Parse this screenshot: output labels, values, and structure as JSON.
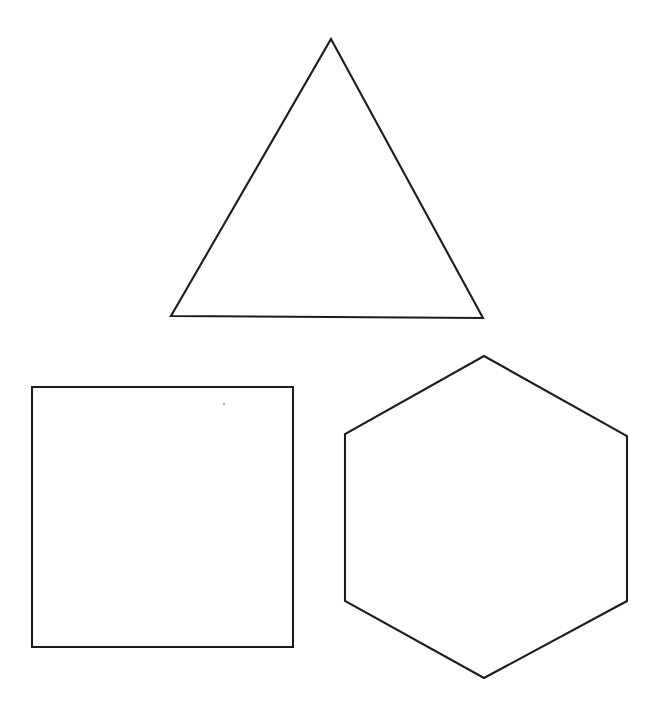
{
  "canvas": {
    "width": 665,
    "height": 714,
    "background_color": "#ffffff",
    "stroke_color": "#1c1c1c",
    "stroke_width": 2.1
  },
  "figure": {
    "shape_count": 3
  },
  "shapes": [
    {
      "id": "triangle",
      "name": "Triangle",
      "sides": 3,
      "fill": "none",
      "stroke_color": "#1c1c1c",
      "points": "331,39 483,318 171,316",
      "vertices": [
        {
          "label": "apex",
          "x": 331,
          "y": 39
        },
        {
          "label": "bottom-right",
          "x": 483,
          "y": 318
        },
        {
          "label": "bottom-left",
          "x": 171,
          "y": 316
        }
      ],
      "bounds": {
        "x": 171,
        "y": 39,
        "width": 312,
        "height": 279
      }
    },
    {
      "id": "square",
      "name": "Square",
      "sides": 4,
      "fill": "none",
      "stroke_color": "#1c1c1c",
      "points": "32,387 293,387 293,647 32,647",
      "vertices": [
        {
          "label": "top-left",
          "x": 32,
          "y": 387
        },
        {
          "label": "top-right",
          "x": 293,
          "y": 387
        },
        {
          "label": "bottom-right",
          "x": 293,
          "y": 647
        },
        {
          "label": "bottom-left",
          "x": 32,
          "y": 647
        }
      ],
      "bounds": {
        "x": 32,
        "y": 387,
        "width": 261,
        "height": 260
      }
    },
    {
      "id": "hexagon",
      "name": "Hexagon",
      "sides": 6,
      "fill": "none",
      "stroke_color": "#1c1c1c",
      "points": "484,356 627,436 627,601 484,678 345,601 345,434",
      "vertices": [
        {
          "label": "top",
          "x": 484,
          "y": 356
        },
        {
          "label": "upper-right",
          "x": 627,
          "y": 436
        },
        {
          "label": "lower-right",
          "x": 627,
          "y": 601
        },
        {
          "label": "bottom",
          "x": 484,
          "y": 678
        },
        {
          "label": "lower-left",
          "x": 345,
          "y": 601
        },
        {
          "label": "upper-left",
          "x": 345,
          "y": 434
        }
      ],
      "bounds": {
        "x": 345,
        "y": 356,
        "width": 282,
        "height": 322
      }
    }
  ],
  "artifacts": [
    {
      "id": "speck",
      "name": "Scan speck",
      "x": 224,
      "y": 404,
      "radius": 1.4,
      "color": "#b9b9b9"
    }
  ]
}
